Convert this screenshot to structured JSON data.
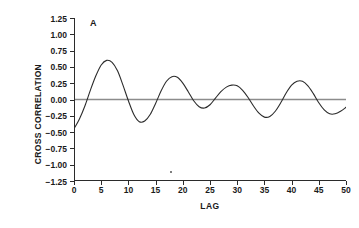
{
  "panel": {
    "letter": "A"
  },
  "axes": {
    "ylabel": "CROSS CORRELATION",
    "xlabel": "LAG",
    "yticks": [
      "1.25",
      "1.00",
      "0.75",
      "0.50",
      "0.25",
      "0.00",
      "-0.25",
      "-0.50",
      "-0.75",
      "-1.00",
      "-1.25"
    ],
    "xticks": [
      "0",
      "5",
      "10",
      "15",
      "20",
      "25",
      "30",
      "35",
      "40",
      "45",
      "50"
    ]
  },
  "colors": {
    "curve": "#2b2b2b",
    "zero_line": "#8c8c8c",
    "axis": "#2b2b2b",
    "background": "#ffffff"
  },
  "chart_data": {
    "type": "line",
    "title": "A",
    "xlabel": "LAG",
    "ylabel": "CROSS CORRELATION",
    "xlim": [
      0,
      50
    ],
    "ylim": [
      -1.25,
      1.25
    ],
    "xtick_values": [
      0,
      5,
      10,
      15,
      20,
      25,
      30,
      35,
      40,
      45,
      50
    ],
    "ytick_values": [
      -1.25,
      -1.0,
      -0.75,
      -0.5,
      -0.25,
      0.0,
      0.25,
      0.5,
      0.75,
      1.0,
      1.25
    ],
    "grid": false,
    "legend": null,
    "reference_lines": [
      {
        "type": "horizontal",
        "y": 0.0,
        "color": "#8c8c8c"
      }
    ],
    "series": [
      {
        "name": "cross correlation",
        "x": [
          0,
          1,
          2,
          3,
          4,
          5,
          6,
          7,
          8,
          9,
          10,
          11,
          12,
          13,
          14,
          15,
          16,
          17,
          18,
          19,
          20,
          21,
          22,
          23,
          24,
          25,
          26,
          27,
          28,
          29,
          30,
          31,
          32,
          33,
          34,
          35,
          36,
          37,
          38,
          39,
          40,
          41,
          42,
          43,
          44,
          45,
          46,
          47,
          48,
          49,
          50
        ],
        "y": [
          -0.45,
          -0.3,
          -0.1,
          0.14,
          0.36,
          0.53,
          0.6,
          0.57,
          0.44,
          0.22,
          -0.02,
          -0.23,
          -0.34,
          -0.33,
          -0.23,
          -0.06,
          0.13,
          0.28,
          0.35,
          0.34,
          0.25,
          0.12,
          -0.02,
          -0.11,
          -0.13,
          -0.08,
          0.02,
          0.12,
          0.19,
          0.22,
          0.21,
          0.14,
          0.03,
          -0.1,
          -0.21,
          -0.27,
          -0.26,
          -0.18,
          -0.05,
          0.1,
          0.22,
          0.28,
          0.28,
          0.21,
          0.09,
          -0.05,
          -0.16,
          -0.22,
          -0.22,
          -0.18,
          -0.12
        ]
      }
    ],
    "key_points": {
      "start_value": -0.45,
      "peaks": [
        {
          "lag": 6,
          "value": 0.6
        },
        {
          "lag": 18,
          "value": 0.35
        },
        {
          "lag": 29,
          "value": 0.22
        },
        {
          "lag": 42,
          "value": 0.28
        }
      ],
      "troughs": [
        {
          "lag": 12,
          "value": -0.34
        },
        {
          "lag": 24,
          "value": -0.13
        },
        {
          "lag": 35,
          "value": -0.27
        },
        {
          "lag": 47,
          "value": -0.22
        }
      ]
    }
  }
}
